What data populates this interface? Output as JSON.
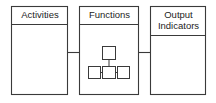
{
  "diagram": {
    "type": "flow-block-diagram",
    "orientation": "horizontal",
    "stroke_color": "#3a3a3a",
    "background_color": "#ffffff",
    "boxes": [
      {
        "id": "activities",
        "label": "Activities",
        "header_lines": 1,
        "body_content": "empty"
      },
      {
        "id": "functions",
        "label": "Functions",
        "header_lines": 1,
        "body_content": "hierarchy-tree"
      },
      {
        "id": "output-indicators",
        "label": "Output\nIndicators",
        "header_lines": 2,
        "body_content": "empty"
      }
    ],
    "connectors": [
      {
        "from": "activities",
        "to": "functions"
      },
      {
        "from": "functions",
        "to": "output-indicators"
      }
    ],
    "tree": {
      "root_count": 1,
      "leaf_count": 3,
      "description": "one parent node above three child nodes"
    }
  }
}
